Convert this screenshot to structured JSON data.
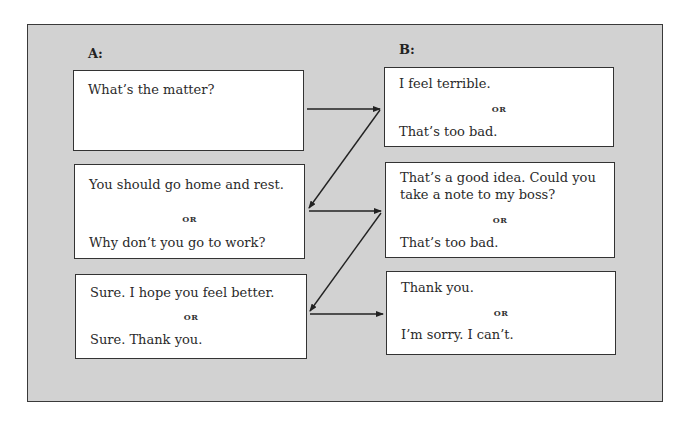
{
  "columns": {
    "a": {
      "label": "A:",
      "boxes": [
        {
          "lines": [
            "What’s the matter?"
          ]
        },
        {
          "first": "You should go home and rest.",
          "or": "OR",
          "second": "Why don’t you go to work?"
        },
        {
          "first": "Sure. I hope you feel better.",
          "or": "OR",
          "second": "Sure. Thank you."
        }
      ]
    },
    "b": {
      "label": "B:",
      "boxes": [
        {
          "first": "I feel terrible.",
          "or": "OR",
          "second": "That’s too bad."
        },
        {
          "first_l1": "That’s a good idea. Could you",
          "first_l2": "take a note to my boss?",
          "or": "OR",
          "second": "That’s too bad."
        },
        {
          "first": "Thank you.",
          "or": "OR",
          "second": "I’m sorry. I can’t."
        }
      ]
    }
  },
  "arrows": [
    {
      "from": "a.0",
      "to": "b.0"
    },
    {
      "from": "b.0",
      "to": "a.1"
    },
    {
      "from": "a.1",
      "to": "b.1"
    },
    {
      "from": "b.1",
      "to": "a.2"
    },
    {
      "from": "a.2",
      "to": "b.2"
    }
  ],
  "colors": {
    "panel": "#d2d2d2",
    "box": "#ffffff",
    "border": "#333333"
  }
}
